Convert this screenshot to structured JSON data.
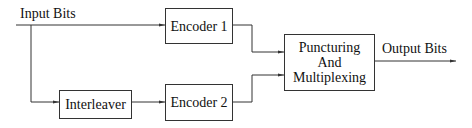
{
  "diagram": {
    "type": "block-diagram",
    "title": "",
    "input_label": "Input Bits",
    "output_label": "Output Bits",
    "blocks": {
      "encoder1": "Encoder 1",
      "interleaver": "Interleaver",
      "encoder2": "Encoder 2",
      "punct_line1": "Puncturing",
      "punct_line2": "And",
      "punct_line3": "Multiplexing"
    },
    "edges": [
      {
        "from": "Input Bits",
        "to": "Encoder 1"
      },
      {
        "from": "Input Bits",
        "to": "Interleaver"
      },
      {
        "from": "Interleaver",
        "to": "Encoder 2"
      },
      {
        "from": "Encoder 1",
        "to": "Puncturing And Multiplexing"
      },
      {
        "from": "Encoder 2",
        "to": "Puncturing And Multiplexing"
      },
      {
        "from": "Puncturing And Multiplexing",
        "to": "Output Bits"
      }
    ],
    "colors": {
      "line": "#333333",
      "background": "#ffffff"
    }
  }
}
